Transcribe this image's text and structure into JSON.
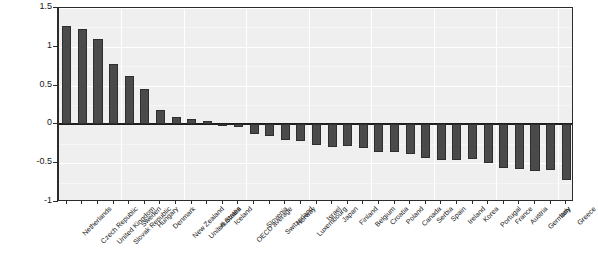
{
  "chart_data": {
    "type": "bar",
    "title": "",
    "subtitle": "",
    "xlabel": "",
    "ylabel": "",
    "ylim": [
      -1,
      1.5
    ],
    "ytick_labels": [
      "1.5",
      "1",
      "0.5",
      "0",
      "-0.5",
      "-1"
    ],
    "ytick_values": [
      1.5,
      1,
      0.5,
      0,
      -0.5,
      -1
    ],
    "grid": true,
    "legend": false,
    "legend_position": "none",
    "bar_color": "#4a4a4a",
    "plot_background": "#efefef",
    "categories": [
      "Netherlands",
      "Czech Republic",
      "United Kingdom",
      "Slovak Republic",
      "Sweden",
      "Hungary",
      "Denmark",
      "New Zealand",
      "United States",
      "Australia",
      "Iceland",
      "OECD average",
      "Slovenia",
      "Switzerland",
      "Norway",
      "Luxembourg",
      "Israel",
      "Japan",
      "Finland",
      "Belgium",
      "Croatia",
      "Poland",
      "Canada",
      "Serbia",
      "Spain",
      "Ireland",
      "Korea",
      "Portugal",
      "France",
      "Austria",
      "Germany",
      "Italy",
      "Greece"
    ],
    "values": [
      1.27,
      1.23,
      1.1,
      0.78,
      0.62,
      0.46,
      0.18,
      0.1,
      0.07,
      0.04,
      -0.02,
      -0.03,
      -0.13,
      -0.15,
      -0.2,
      -0.21,
      -0.26,
      -0.29,
      -0.28,
      -0.31,
      -0.36,
      -0.36,
      -0.38,
      -0.43,
      -0.46,
      -0.46,
      -0.45,
      -0.5,
      -0.56,
      -0.58,
      -0.6,
      -0.59,
      -0.72
    ]
  }
}
